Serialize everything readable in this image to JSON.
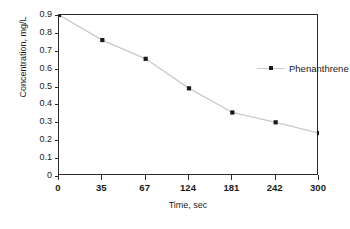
{
  "chart_data": {
    "type": "line",
    "title": "",
    "xlabel": "Time, sec",
    "ylabel": "Concentration, mg/L",
    "categories": [
      "0",
      "35",
      "67",
      "124",
      "181",
      "242",
      "300"
    ],
    "x": [
      0,
      35,
      67,
      124,
      181,
      242,
      300
    ],
    "series": [
      {
        "name": "Phenanthrene",
        "values": [
          0.9,
          0.76,
          0.655,
          0.49,
          0.355,
          0.3,
          0.24
        ],
        "marker": "square",
        "marker_color": "#1a1a1a",
        "line_color": "#c9c9c9"
      }
    ],
    "yticks": [
      "0.9",
      "0.8",
      "0.7",
      "0.6",
      "0.5",
      "0.4",
      "0.3",
      "0.2",
      "0.1",
      "0"
    ],
    "ytick_values": [
      0.9,
      0.8,
      0.7,
      0.6,
      0.5,
      0.4,
      0.3,
      0.2,
      0.1,
      0.0
    ],
    "ylim": [
      0,
      0.9
    ],
    "grid": false,
    "legend_position": "upper-right-inside",
    "axis_color": "#2b2b2b",
    "background": "#ffffff"
  },
  "legend": {
    "entries": [
      {
        "label": "Phenanthrene"
      }
    ]
  }
}
